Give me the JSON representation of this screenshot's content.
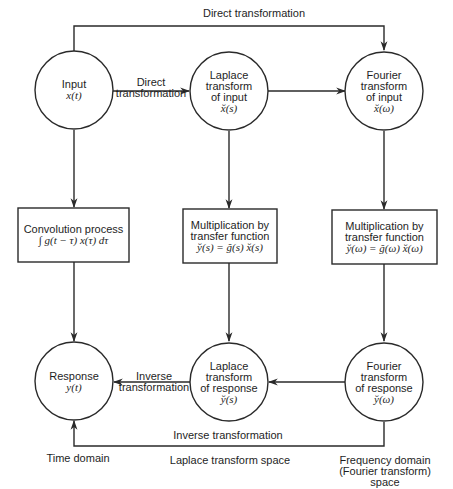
{
  "diagram": {
    "top_edge_label": "Direct transformation",
    "nodes": {
      "input": {
        "lines": [
          "Input"
        ],
        "math": "x(t)"
      },
      "laplace_input": {
        "lines": [
          "Laplace",
          "transform",
          "of input"
        ],
        "math": "x̆(s)"
      },
      "fourier_input": {
        "lines": [
          "Fourier",
          "transform",
          "of input"
        ],
        "math": "x̆(ω)"
      },
      "convolution": {
        "lines": [
          "Convolution process"
        ],
        "math": "∫ g(t − τ) x(τ) dτ"
      },
      "mult_laplace": {
        "lines": [
          "Multiplication by",
          "transfer function"
        ],
        "math": "y̆(s) = ğ(s) x̆(s)"
      },
      "mult_fourier": {
        "lines": [
          "Multiplication by",
          "transfer function"
        ],
        "math": "y̆(ω) = ğ(ω) x̆(ω)"
      },
      "response": {
        "lines": [
          "Response"
        ],
        "math": "y(t)"
      },
      "laplace_response": {
        "lines": [
          "Laplace",
          "transform",
          "of response"
        ],
        "math": "y̆(s)"
      },
      "fourier_response": {
        "lines": [
          "Fourier",
          "transform",
          "of response"
        ],
        "math": "y̆(ω)"
      }
    },
    "edge_labels": {
      "input_to_laplace": [
        "Direct",
        "transformation"
      ],
      "laplace_to_response": [
        "Inverse",
        "transformation"
      ],
      "bottom": "Inverse transformation"
    },
    "column_labels": {
      "time": "Time domain",
      "laplace": "Laplace transform space",
      "frequency": [
        "Frequency domain",
        "(Fourier transform)",
        "space"
      ]
    },
    "colors": {
      "stroke": "#2a2a2a",
      "text": "#1e1e1e",
      "background": "#ffffff"
    }
  }
}
